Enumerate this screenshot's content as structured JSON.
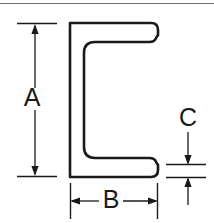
{
  "drawing": {
    "title": "C-channel cross-section dimension drawing",
    "background_color": "#ffffff",
    "line_color": "#1a1a1a",
    "dimension_color": "#1a1a1a",
    "border": {
      "top_line_color": "#6e6e6e",
      "visible": true
    },
    "profile": {
      "name": "c-channel-profile",
      "description": "Structural C channel seen in cross-section, opening to the right",
      "outer": {
        "left": 70,
        "right": 158,
        "top": 23,
        "bottom": 177
      },
      "web_thickness": 9,
      "flange_thickness": 12,
      "inner_fillet_radius": 11,
      "tip_radius": 7
    },
    "dimensions": [
      {
        "name": "dimension-a",
        "label": "A",
        "orientation": "vertical",
        "measures": "overall-height",
        "label_x": 32,
        "label_y": 99,
        "line_x": 35,
        "start_y": 24,
        "end_y": 176,
        "ext_start_x": 17,
        "ext_end_x": 57,
        "arrow_style": "inward-double"
      },
      {
        "name": "dimension-b",
        "label": "B",
        "orientation": "horizontal",
        "measures": "overall-width",
        "label_x": 111,
        "label_y": 201,
        "line_y": 201,
        "start_x": 70,
        "end_x": 158,
        "ext_start_y": 183,
        "ext_end_y": 219,
        "arrow_style": "outward-double"
      },
      {
        "name": "dimension-c",
        "label": "C",
        "orientation": "vertical",
        "measures": "flange-thickness",
        "label_x": 188,
        "label_y": 119,
        "line_x": 188,
        "start_y": 165,
        "end_y": 177,
        "ext_start_x": 166,
        "ext_end_x": 206,
        "arrow_style": "outside-inward"
      }
    ]
  }
}
